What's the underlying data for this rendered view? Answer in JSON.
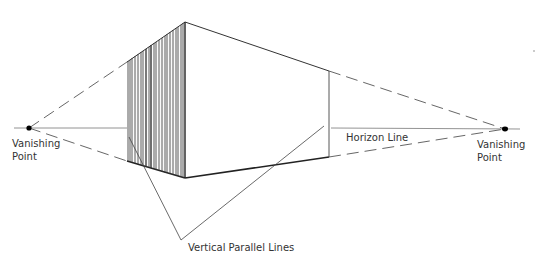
{
  "diagram": {
    "labels": {
      "vanishing_point_left": [
        "Vanishing",
        "Point"
      ],
      "vanishing_point_right": [
        "Vanishing",
        "Point"
      ],
      "horizon_line": "Horizon Line",
      "vertical_parallel_lines": "Vertical Parallel Lines"
    },
    "colors": {
      "line": "#333333",
      "dash": "#555555",
      "point": "#000000",
      "background": "#ffffff"
    }
  }
}
